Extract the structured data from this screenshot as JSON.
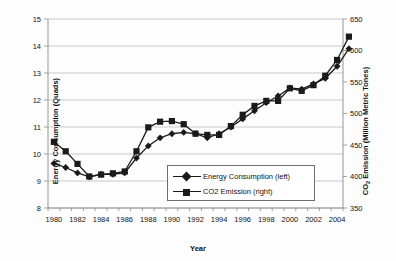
{
  "chart_data": {
    "type": "line",
    "title": "",
    "xlabel": "Year",
    "ylabel": "Energy Consumption (Quads)",
    "y2label": "CO2 Emission (Million Metric Tones)",
    "y2label_parts": {
      "pre": "CO",
      "sub": "2",
      "post": " Emission (Million Metric Tones)"
    },
    "grid": true,
    "legend_position": "inside-bottom-right",
    "xlim": [
      1980,
      2005
    ],
    "ylim": [
      8,
      15
    ],
    "y2lim": [
      350,
      650
    ],
    "yticks": [
      8,
      9,
      10,
      11,
      12,
      13,
      14,
      15
    ],
    "y2ticks": [
      350,
      400,
      450,
      500,
      550,
      600,
      650
    ],
    "xticks": [
      1980,
      1982,
      1984,
      1986,
      1988,
      1990,
      1992,
      1994,
      1996,
      1998,
      2000,
      2002,
      2004
    ],
    "x": [
      1980,
      1981,
      1982,
      1983,
      1984,
      1985,
      1986,
      1987,
      1988,
      1989,
      1990,
      1991,
      1992,
      1993,
      1994,
      1995,
      1996,
      1997,
      1998,
      1999,
      2000,
      2001,
      2002,
      2003,
      2004,
      2005
    ],
    "series": [
      {
        "name": "Energy Consumption (left)",
        "axis": "left",
        "marker": "diamond",
        "units": "Quads",
        "values": [
          9.65,
          9.5,
          9.3,
          9.15,
          9.25,
          9.25,
          9.3,
          9.85,
          10.3,
          10.6,
          10.75,
          10.8,
          10.75,
          10.6,
          10.75,
          11.0,
          11.3,
          11.6,
          11.9,
          12.15,
          12.45,
          12.4,
          12.6,
          12.8,
          13.25,
          13.9
        ]
      },
      {
        "name": "CO2 Emission (right)",
        "axis": "right",
        "marker": "square",
        "units": "Million Metric Tones",
        "values": [
          455,
          440,
          420,
          400,
          403,
          405,
          408,
          440,
          478,
          487,
          488,
          483,
          468,
          466,
          466,
          480,
          498,
          512,
          520,
          520,
          540,
          536,
          545,
          560,
          585,
          622
        ]
      }
    ],
    "legend": [
      {
        "label": "Energy Consumption (left)",
        "marker": "diamond"
      },
      {
        "label": "CO2 Emission (right)",
        "marker": "square"
      }
    ]
  }
}
